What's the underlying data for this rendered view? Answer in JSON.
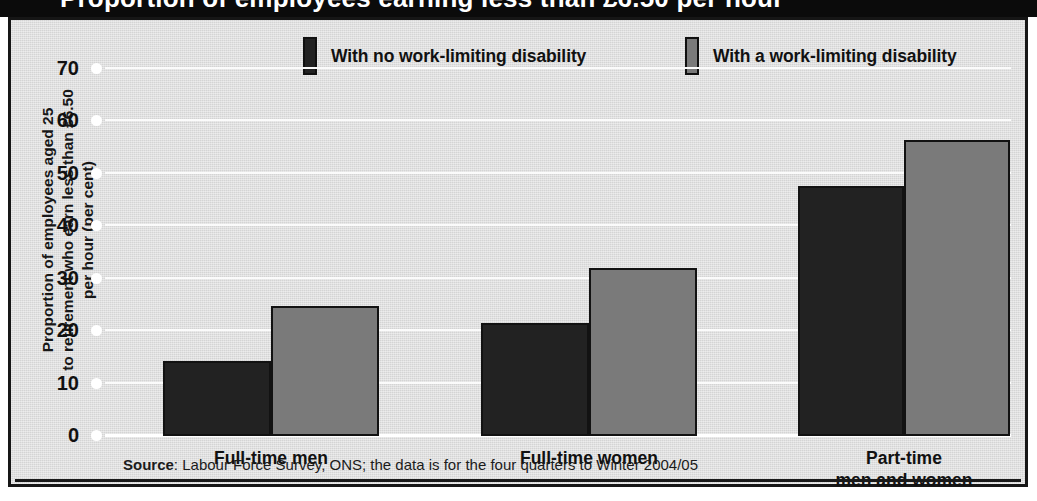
{
  "header": {
    "title": "Proportion of employees earning less than £6.50 per hour"
  },
  "figure": {
    "legend": [
      {
        "label": "With no work-limiting disability",
        "color": "#222222"
      },
      {
        "label": "With a work-limiting disability",
        "color": "#7a7a7a"
      }
    ],
    "y_axis_title_lines": [
      "Proportion of employees aged 25",
      "to retirement who earn less than £6.50",
      "per hour (per cent)"
    ],
    "source_label": "Source",
    "source_text": ": Labour Force Survey, ONS; the data is for the four quarters to Winter 2004/05"
  },
  "chart_data": {
    "type": "bar",
    "title": "Proportion of employees earning less than £6.50 per hour",
    "xlabel": "",
    "ylabel": "Proportion of employees aged 25 to retirement who earn less than £6.50 per hour (per cent)",
    "ylim": [
      0,
      70
    ],
    "yticks": [
      0,
      10,
      20,
      30,
      40,
      50,
      60,
      70
    ],
    "ytick_labels": [
      "0",
      "10",
      "20",
      "30",
      "40",
      "50",
      "60",
      "70"
    ],
    "grid": true,
    "legend_position": "top",
    "categories": [
      "Full-time men",
      "Full-time women",
      "Part-time\nmen and women"
    ],
    "series": [
      {
        "name": "With no work-limiting disability",
        "color": "#222222",
        "values": [
          14.2,
          21.3,
          47.4
        ]
      },
      {
        "name": "With a work-limiting disability",
        "color": "#7a7a7a",
        "values": [
          24.7,
          31.8,
          56.2
        ]
      }
    ],
    "annotations": [
      "Source: Labour Force Survey, ONS; the data is for the four quarters to Winter 2004/05"
    ]
  }
}
